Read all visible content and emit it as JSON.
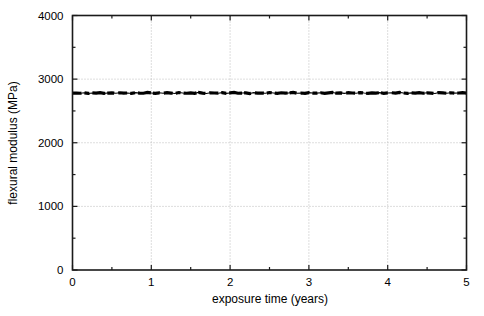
{
  "chart_data": {
    "type": "line",
    "title": "",
    "xlabel": "exposure time (years)",
    "ylabel": "flexural modulus (MPa)",
    "xlim": [
      0,
      5
    ],
    "ylim": [
      0,
      4000
    ],
    "xticks": [
      0,
      1,
      2,
      3,
      4,
      5
    ],
    "xtick_labels": [
      "0",
      "1",
      "2",
      "3",
      "4",
      "5"
    ],
    "yticks": [
      0,
      1000,
      2000,
      3000,
      4000
    ],
    "ytick_labels": [
      "0",
      "1000",
      "2000",
      "3000",
      "4000"
    ],
    "x_minor_ticks": [
      0.5,
      1.5,
      2.5,
      3.5,
      4.5
    ],
    "y_minor_ticks": [
      500,
      1500,
      2500,
      3500
    ],
    "grid": true,
    "grid_style": "dotted",
    "grid_color": "#bbbbbb",
    "legend": null,
    "series": [
      {
        "name": "flexural modulus",
        "style": "dashed-dotted thick black line",
        "color": "#000000",
        "x": [
          0.0,
          0.05,
          0.1,
          0.15,
          0.2,
          0.25,
          0.3,
          0.35,
          0.4,
          0.45,
          0.5,
          0.55,
          0.6,
          0.65,
          0.7,
          0.75,
          0.8,
          0.85,
          0.9,
          0.95,
          1.0,
          1.05,
          1.1,
          1.15,
          1.2,
          1.25,
          1.3,
          1.35,
          1.4,
          1.45,
          1.5,
          1.55,
          1.6,
          1.65,
          1.7,
          1.75,
          1.8,
          1.85,
          1.9,
          1.95,
          2.0,
          2.05,
          2.1,
          2.15,
          2.2,
          2.25,
          2.3,
          2.35,
          2.4,
          2.45,
          2.5,
          2.55,
          2.6,
          2.65,
          2.7,
          2.75,
          2.8,
          2.85,
          2.9,
          2.95,
          3.0,
          3.05,
          3.1,
          3.15,
          3.2,
          3.25,
          3.3,
          3.35,
          3.4,
          3.45,
          3.5,
          3.55,
          3.6,
          3.65,
          3.7,
          3.75,
          3.8,
          3.85,
          3.9,
          3.95,
          4.0,
          4.05,
          4.1,
          4.15,
          4.2,
          4.25,
          4.3,
          4.35,
          4.4,
          4.45,
          4.5,
          4.55,
          4.6,
          4.65,
          4.7,
          4.75,
          4.8,
          4.85,
          4.9,
          4.95,
          5.0
        ],
        "y": [
          2780,
          2782,
          2778,
          2785,
          2775,
          2783,
          2779,
          2788,
          2776,
          2781,
          2784,
          2777,
          2786,
          2779,
          2782,
          2775,
          2788,
          2780,
          2778,
          2790,
          2783,
          2776,
          2785,
          2779,
          2787,
          2781,
          2774,
          2789,
          2782,
          2778,
          2784,
          2777,
          2791,
          2780,
          2775,
          2786,
          2782,
          2779,
          2788,
          2776,
          2783,
          2790,
          2778,
          2781,
          2785,
          2774,
          2787,
          2780,
          2782,
          2777,
          2789,
          2783,
          2776,
          2786,
          2779,
          2784,
          2791,
          2778,
          2782,
          2775,
          2788,
          2781,
          2780,
          2786,
          2777,
          2783,
          2790,
          2779,
          2784,
          2776,
          2787,
          2782,
          2778,
          2789,
          2781,
          2775,
          2785,
          2780,
          2788,
          2777,
          2783,
          2786,
          2779,
          2791,
          2782,
          2776,
          2784,
          2780,
          2787,
          2778,
          2785,
          2781,
          2774,
          2789,
          2783,
          2777,
          2786,
          2780,
          2782,
          2788,
          2780
        ]
      }
    ]
  },
  "axes": {
    "x_title": "exposure time (years)",
    "y_title": "flexural modulus (MPa)"
  }
}
